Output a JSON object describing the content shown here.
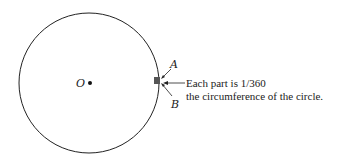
{
  "diagram": {
    "center_label": "O",
    "point_a_label": "A",
    "point_b_label": "B",
    "annotation_line1": "Each part is 1/360",
    "annotation_line2": "the circumference of the circle.",
    "stroke_color": "#222222",
    "segment_color": "#555555"
  }
}
